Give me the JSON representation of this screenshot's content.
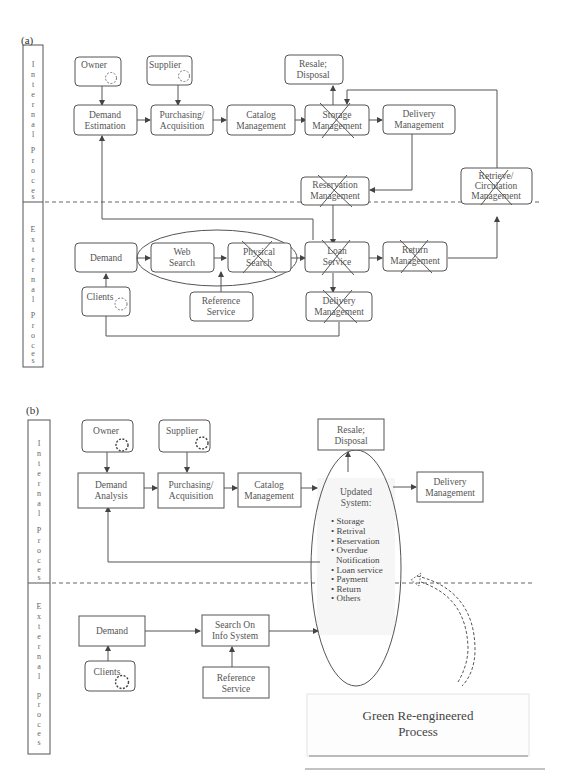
{
  "panel_a": {
    "label": "(a)",
    "lanes": {
      "internal": "Internal Process",
      "external": "External Process"
    },
    "nodes": {
      "owner": "Owner",
      "supplier": "Supplier",
      "resale_1": "Resale;",
      "resale_2": "Disposal",
      "demand_est_1": "Demand",
      "demand_est_2": "Estimation",
      "purchasing_1": "Purchasing/",
      "purchasing_2": "Acquisition",
      "catalog_1": "Catalog",
      "catalog_2": "Management",
      "storage_1": "Storage",
      "storage_2": "Management",
      "delivery_1": "Delivery",
      "delivery_2": "Management",
      "reservation_1": "Reservation",
      "reservation_2": "Management",
      "retrieve_1": "Retrieve/",
      "retrieve_2": "Circulation",
      "retrieve_3": "Management",
      "demand": "Demand",
      "web_1": "Web",
      "web_2": "Search",
      "physical_1": "Physical",
      "physical_2": "Search",
      "loan_1": "Loan",
      "loan_2": "Service",
      "return_1": "Return",
      "return_2": "Management",
      "clients": "Clients",
      "reference_1": "Reference",
      "reference_2": "Service",
      "ext_delivery_1": "Delivery",
      "ext_delivery_2": "Management"
    },
    "crossed_out": [
      "Storage Management",
      "Reservation Management",
      "Retrieve/Circulation Management",
      "Physical Search",
      "Loan Service",
      "Return Management",
      "Delivery Management (external)"
    ]
  },
  "panel_b": {
    "label": "(b)",
    "lanes": {
      "internal": "Internal Process",
      "external": "External process"
    },
    "nodes": {
      "owner": "Owner",
      "supplier": "Supplier",
      "resale_1": "Resale;",
      "resale_2": "Disposal",
      "demand_analysis_1": "Demand",
      "demand_analysis_2": "Analysis",
      "purchasing_1": "Purchasing/",
      "purchasing_2": "Acquisition",
      "catalog_1": "Catalog",
      "catalog_2": "Management",
      "delivery_1": "Delivery",
      "delivery_2": "Management",
      "demand": "Demand",
      "clients": "Clients",
      "search_1": "Search On",
      "search_2": "Info System",
      "reference_1": "Reference",
      "reference_2": "Service"
    },
    "updated_system": {
      "title_1": "Updated",
      "title_2": "System:",
      "items": [
        "• Storage",
        "• Retrival",
        "• Reservation",
        "• Overdue",
        "   Notification",
        "• Loan service",
        "• Payment",
        "• Return",
        "• Others"
      ]
    },
    "callout_1": "Green Re-engineered",
    "callout_2": "Process"
  }
}
